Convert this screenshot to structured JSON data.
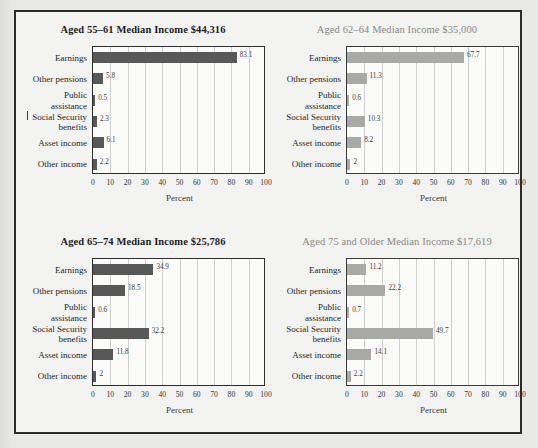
{
  "figure": {
    "axis_label": "Percent",
    "categories": [
      "Earnings",
      "Other pensions",
      "Public\nassistance",
      "Social Security\nbenefits",
      "Asset income",
      "Other income"
    ],
    "xticks": [
      "0",
      "10",
      "20",
      "30",
      "40",
      "50",
      "60",
      "70",
      "80",
      "90",
      "100"
    ],
    "colors": {
      "bar_dark": "#585858",
      "bar_light": "#a9a9a7",
      "title_dark": "#1d1d1d",
      "title_light": "#8a8a88",
      "frame": "#2b2b2b",
      "gridline": "#cfcfcf",
      "page_background": "#f3f3f1"
    }
  },
  "chart_data": [
    {
      "type": "bar",
      "title": "Aged 55–61 Median Income $44,316",
      "xlabel": "Percent",
      "ylabel": "",
      "xlim": [
        0,
        100
      ],
      "grid": true,
      "orientation": "horizontal",
      "emphasis": "dark",
      "categories": [
        "Earnings",
        "Other pensions",
        "Public assistance",
        "Social Security benefits",
        "Asset income",
        "Other income"
      ],
      "values": [
        83.1,
        5.8,
        0.5,
        2.3,
        6.1,
        2.2
      ],
      "value_labels": [
        "83.1",
        "5.8",
        "0.5",
        "2.3",
        "6.1",
        "2.2"
      ]
    },
    {
      "type": "bar",
      "title": "Aged 62–64 Median Income $35,000",
      "xlabel": "Percent",
      "ylabel": "",
      "xlim": [
        0,
        100
      ],
      "grid": true,
      "orientation": "horizontal",
      "emphasis": "light",
      "categories": [
        "Earnings",
        "Other pensions",
        "Public assistance",
        "Social Security benefits",
        "Asset income",
        "Other income"
      ],
      "values": [
        67.7,
        11.3,
        0.6,
        10.3,
        8.2,
        2
      ],
      "value_labels": [
        "67.7",
        "11.3",
        "0.6",
        "10.3",
        "8.2",
        "2"
      ]
    },
    {
      "type": "bar",
      "title": "Aged 65–74 Median Income $25,786",
      "xlabel": "Percent",
      "ylabel": "",
      "xlim": [
        0,
        100
      ],
      "grid": true,
      "orientation": "horizontal",
      "emphasis": "dark",
      "categories": [
        "Earnings",
        "Other pensions",
        "Public assistance",
        "Social Security benefits",
        "Asset income",
        "Other income"
      ],
      "values": [
        34.9,
        18.5,
        0.6,
        32.2,
        11.8,
        2
      ],
      "value_labels": [
        "34.9",
        "18.5",
        "0.6",
        "32.2",
        "11.8",
        "2"
      ]
    },
    {
      "type": "bar",
      "title": "Aged 75 and Older Median Income $17,619",
      "xlabel": "Percent",
      "ylabel": "",
      "xlim": [
        0,
        100
      ],
      "grid": true,
      "orientation": "horizontal",
      "emphasis": "light",
      "categories": [
        "Earnings",
        "Other pensions",
        "Public assistance",
        "Social Security benefits",
        "Asset income",
        "Other income"
      ],
      "values": [
        11.2,
        22.2,
        0.7,
        49.7,
        14.1,
        2.2
      ],
      "value_labels": [
        "11.2",
        "22.2",
        "0.7",
        "49.7",
        "14.1",
        "2.2"
      ]
    }
  ]
}
